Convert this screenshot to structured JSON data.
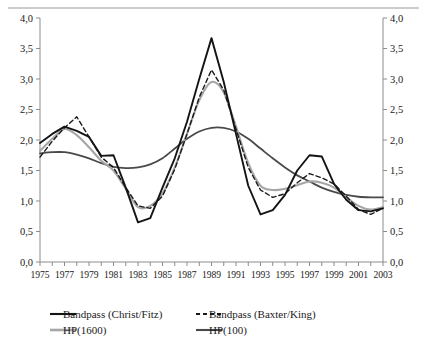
{
  "chart_data": {
    "type": "line",
    "title": "",
    "subtitle": "",
    "xlabel": "",
    "ylabel": "",
    "xlim": [
      1975,
      2003
    ],
    "ylim": [
      0.0,
      4.0
    ],
    "ytick_step": 0.5,
    "grid": false,
    "decimal_separator": ",",
    "dual_y_axis": true,
    "legend_position": "bottom",
    "x": [
      1975,
      1976,
      1977,
      1978,
      1979,
      1980,
      1981,
      1982,
      1983,
      1984,
      1985,
      1986,
      1987,
      1988,
      1989,
      1990,
      1991,
      1992,
      1993,
      1994,
      1995,
      1996,
      1997,
      1998,
      1999,
      2000,
      2001,
      2002,
      2003
    ],
    "xticklabels": [
      "1975",
      "1977",
      "1979",
      "1981",
      "1983",
      "1985",
      "1987",
      "1989",
      "1991",
      "1993",
      "1995",
      "1997",
      "1999",
      "2001",
      "2003"
    ],
    "yticklabels": [
      "0,0",
      "0,5",
      "1,0",
      "1,5",
      "2,0",
      "2,5",
      "3,0",
      "3,5",
      "4,0"
    ],
    "yticklabels_right": [
      "0,0",
      "0,5",
      "1,0",
      "1,5",
      "2,0",
      "2,5",
      "3,0",
      "3,5",
      "4,0"
    ],
    "series": [
      {
        "name": "Bandpass (Christ/Fitz)",
        "key": "bandpass_christ_fitz",
        "style": "solid",
        "color": "#141414",
        "width": 1.9,
        "values": [
          1.95,
          2.1,
          2.22,
          2.15,
          2.05,
          1.74,
          1.75,
          1.22,
          0.65,
          0.72,
          1.22,
          1.7,
          2.3,
          3.0,
          3.67,
          2.95,
          2.1,
          1.25,
          0.78,
          0.85,
          1.1,
          1.5,
          1.75,
          1.73,
          1.28,
          1.02,
          0.85,
          0.83,
          0.88
        ]
      },
      {
        "name": "Bandpass (Baxter/King)",
        "key": "bandpass_baxter_king",
        "style": "dashed",
        "color": "#1a1a1a",
        "width": 1.4,
        "values": [
          1.72,
          1.98,
          2.2,
          2.38,
          2.05,
          1.72,
          1.55,
          1.22,
          0.92,
          0.88,
          1.08,
          1.52,
          2.1,
          2.7,
          3.15,
          2.82,
          2.18,
          1.55,
          1.18,
          1.06,
          1.12,
          1.3,
          1.45,
          1.38,
          1.28,
          1.08,
          0.86,
          0.78,
          0.88
        ]
      },
      {
        "name": "HP(1600)",
        "key": "hp_1600",
        "style": "solid",
        "color": "#a6a6a6",
        "width": 2.1,
        "values": [
          1.82,
          2.02,
          2.18,
          2.08,
          1.88,
          1.66,
          1.5,
          1.2,
          0.9,
          0.92,
          1.12,
          1.55,
          2.1,
          2.65,
          2.95,
          2.78,
          2.22,
          1.62,
          1.25,
          1.18,
          1.2,
          1.26,
          1.32,
          1.3,
          1.22,
          1.06,
          0.92,
          0.86,
          0.9
        ]
      },
      {
        "name": "HP(100)",
        "key": "hp_100",
        "style": "solid",
        "color": "#4a4a4a",
        "width": 1.8,
        "values": [
          1.78,
          1.8,
          1.8,
          1.76,
          1.7,
          1.62,
          1.56,
          1.54,
          1.55,
          1.6,
          1.7,
          1.86,
          2.02,
          2.14,
          2.2,
          2.2,
          2.14,
          2.02,
          1.86,
          1.7,
          1.55,
          1.42,
          1.32,
          1.22,
          1.15,
          1.1,
          1.07,
          1.06,
          1.06
        ]
      }
    ]
  },
  "legend": {
    "entries": [
      {
        "label": "Bandpass (Christ/Fitz)",
        "style": "solid",
        "color": "#141414"
      },
      {
        "label": "Bandpass (Baxter/King)",
        "style": "dashed",
        "color": "#1a1a1a"
      },
      {
        "label": "HP(1600)",
        "style": "solid",
        "color": "#a6a6a6"
      },
      {
        "label": "HP(100)",
        "style": "solid",
        "color": "#4a4a4a"
      }
    ]
  }
}
